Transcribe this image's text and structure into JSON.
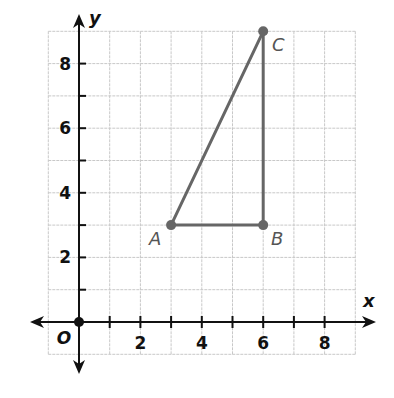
{
  "chart_data": {
    "type": "scatter",
    "title": "",
    "xlabel": "x",
    "ylabel": "y",
    "origin_label": "O",
    "xlim": [
      -1,
      9
    ],
    "ylim": [
      -1,
      9
    ],
    "grid": true,
    "x_ticks": [
      1,
      2,
      3,
      4,
      5,
      6,
      7,
      8
    ],
    "y_ticks": [
      1,
      2,
      3,
      4,
      5,
      6,
      7,
      8
    ],
    "x_tick_labels": [
      "2",
      "4",
      "6",
      "8"
    ],
    "y_tick_labels": [
      "2",
      "4",
      "6",
      "8"
    ],
    "points": [
      {
        "label": "A",
        "x": 3,
        "y": 3
      },
      {
        "label": "B",
        "x": 6,
        "y": 3
      },
      {
        "label": "C",
        "x": 6,
        "y": 9
      }
    ],
    "segments": [
      [
        "A",
        "B"
      ],
      [
        "B",
        "C"
      ],
      [
        "C",
        "A"
      ]
    ],
    "shape": "right triangle ABC",
    "colors": {
      "axis": "#111111",
      "grid": "#c8c8c8",
      "figure": "#666666",
      "point_label": "#555555"
    }
  }
}
